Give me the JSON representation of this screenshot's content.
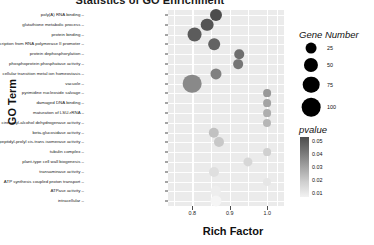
{
  "chart_data": {
    "type": "scatter",
    "title": "Statistics of GO Enrichment",
    "xlabel": "Rich Factor",
    "ylabel": "GO Term",
    "xlim": [
      0.735,
      1.045
    ],
    "xticks": [
      0.8,
      0.9,
      1.0
    ],
    "xtick_labels": [
      "0.8",
      "0.9",
      "1.0"
    ],
    "grid": true,
    "legend_position": "right",
    "categories": [
      "poly(A) RNA binding",
      "glutathione metabolic process",
      "protein binding",
      "regulation of transcription from RNA polymerase II promoter",
      "protein dephosphorylation",
      "phosphoprotein phosphatase activity",
      "cellular transition metal ion homeostasis",
      "vacuole",
      "pyrimidine nucleoside salvage",
      "damaged DNA binding",
      "maturation of LSU-rRNA",
      "cinnamyl-alcohol dehydrogenase activity",
      "beta-glucosidase activity",
      "peptidyl-prolyl cis-trans isomerase activity",
      "tubulin complex",
      "plant-type cell wall biogenesis",
      "transaminase activity",
      "ATP synthesis coupled proton transport",
      "ATPase activity",
      "intracellular"
    ],
    "points": [
      {
        "term": "poly(A) RNA binding",
        "rich_factor": 0.862,
        "gene_number": 33,
        "pvalue": 0.05
      },
      {
        "term": "glutathione metabolic process",
        "rich_factor": 0.84,
        "gene_number": 38,
        "pvalue": 0.048
      },
      {
        "term": "protein binding",
        "rich_factor": 0.806,
        "gene_number": 57,
        "pvalue": 0.046
      },
      {
        "term": "regulation of transcription from RNA polymerase II promoter",
        "rich_factor": 0.858,
        "gene_number": 30,
        "pvalue": 0.044
      },
      {
        "term": "protein dephosphorylation",
        "rich_factor": 0.925,
        "gene_number": 17,
        "pvalue": 0.041
      },
      {
        "term": "phosphoprotein phosphatase activity",
        "rich_factor": 0.922,
        "gene_number": 18,
        "pvalue": 0.039
      },
      {
        "term": "cellular transition metal ion homeostasis",
        "rich_factor": 0.862,
        "gene_number": 26,
        "pvalue": 0.036
      },
      {
        "term": "vacuole",
        "rich_factor": 0.8,
        "gene_number": 100,
        "pvalue": 0.034
      },
      {
        "term": "pyrimidine nucleoside salvage",
        "rich_factor": 1.0,
        "gene_number": 9,
        "pvalue": 0.03
      },
      {
        "term": "damaged DNA binding",
        "rich_factor": 1.0,
        "gene_number": 9,
        "pvalue": 0.027
      },
      {
        "term": "maturation of LSU-rRNA",
        "rich_factor": 1.0,
        "gene_number": 9,
        "pvalue": 0.024
      },
      {
        "term": "cinnamyl-alcohol dehydrogenase activity",
        "rich_factor": 1.0,
        "gene_number": 10,
        "pvalue": 0.022
      },
      {
        "term": "beta-glucosidase activity",
        "rich_factor": 0.858,
        "gene_number": 22,
        "pvalue": 0.019
      },
      {
        "term": "peptidyl-prolyl cis-trans isomerase activity",
        "rich_factor": 0.872,
        "gene_number": 20,
        "pvalue": 0.017
      },
      {
        "term": "tubulin complex",
        "rich_factor": 1.0,
        "gene_number": 9,
        "pvalue": 0.015
      },
      {
        "term": "plant-type cell wall biogenesis",
        "rich_factor": 0.948,
        "gene_number": 15,
        "pvalue": 0.013
      },
      {
        "term": "transaminase activity",
        "rich_factor": 0.858,
        "gene_number": 20,
        "pvalue": 0.011
      },
      {
        "term": "ATP synthesis coupled proton transport",
        "rich_factor": 1.0,
        "gene_number": 10,
        "pvalue": 0.009
      },
      {
        "term": "ATPase activity",
        "rich_factor": 0.862,
        "gene_number": 22,
        "pvalue": 0.007
      },
      {
        "term": "intracellular",
        "rich_factor": 0.862,
        "gene_number": 26,
        "pvalue": 0.005
      }
    ],
    "size_legend": {
      "title": "Gene Number",
      "breaks": [
        25,
        50,
        75,
        100
      ],
      "labels": [
        "25",
        "50",
        "75",
        "100"
      ]
    },
    "color_legend": {
      "title": "pvalue",
      "breaks": [
        0.05,
        0.04,
        0.03,
        0.02,
        0.01
      ],
      "labels": [
        "0.05",
        "0.04",
        "0.03",
        "0.02",
        "0.01"
      ],
      "high_color": "#4d4d4d",
      "low_color": "#f2f2f2"
    }
  }
}
